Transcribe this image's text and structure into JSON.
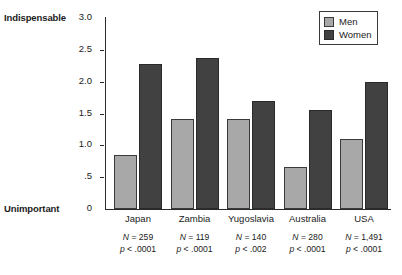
{
  "chart_data": {
    "type": "bar",
    "title": "",
    "subtitle": "",
    "xlabel": "",
    "ylabel": "",
    "ylim": [
      0,
      3.0
    ],
    "yticks": [
      "0",
      ".5",
      "1.0",
      "1.5",
      "2.0",
      "2.5",
      "3.0"
    ],
    "ytick_values": [
      0,
      0.5,
      1.0,
      1.5,
      2.0,
      2.5,
      3.0
    ],
    "grid": false,
    "legend_position": "top-right",
    "axis_endpoint_high": "Indispensable",
    "axis_endpoint_low": "Unimportant",
    "categories": [
      "Japan",
      "Zambia",
      "Yugoslavia",
      "Australia",
      "USA"
    ],
    "series": [
      {
        "name": "Men",
        "color": "#a8a8a8",
        "values": [
          0.85,
          1.41,
          1.41,
          0.66,
          1.1
        ]
      },
      {
        "name": "Women",
        "color": "#414141",
        "values": [
          2.28,
          2.37,
          1.7,
          1.56,
          2.0
        ]
      }
    ],
    "annotations": [
      {
        "n_label": "N",
        "n_value": "= 259",
        "p_label": "p",
        "p_value": "< .0001"
      },
      {
        "n_label": "N",
        "n_value": "= 119",
        "p_label": "p",
        "p_value": "< .0001"
      },
      {
        "n_label": "N",
        "n_value": "= 140",
        "p_label": "p",
        "p_value": "< .002"
      },
      {
        "n_label": "N",
        "n_value": "= 280",
        "p_label": "p",
        "p_value": "< .0001"
      },
      {
        "n_label": "N",
        "n_value": "= 1,491",
        "p_label": "p",
        "p_value": "< .0001"
      }
    ]
  },
  "legend": {
    "items": [
      {
        "label": "Men",
        "color": "#a8a8a8"
      },
      {
        "label": "Women",
        "color": "#414141"
      }
    ]
  }
}
